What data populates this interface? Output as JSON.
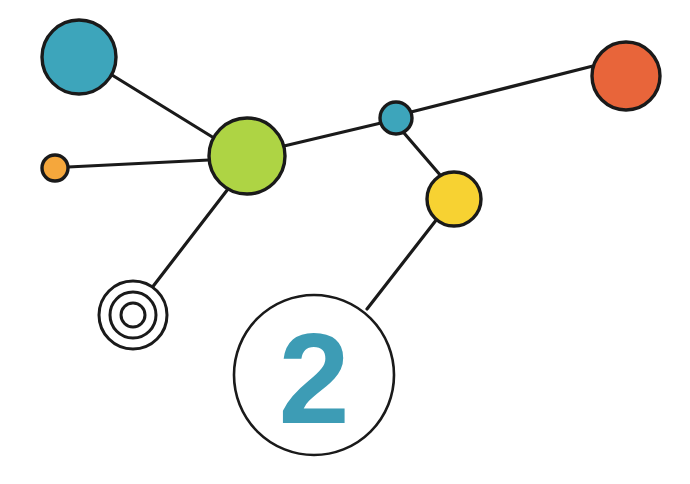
{
  "canvas": {
    "width": 690,
    "height": 484,
    "background": "#ffffff"
  },
  "diagram": {
    "title": "",
    "type": "node-link-network",
    "stroke_color": "#1a1a1a",
    "stroke_width": 3.2
  },
  "palette": {
    "teal": "#3da5bb",
    "green": "#aed444",
    "orange": "#f5a73c",
    "red_orange": "#e8653a",
    "yellow": "#f7d232",
    "outline": "#1a1a1a",
    "white": "#ffffff",
    "badge_text": "#3d9cb5"
  },
  "nodes": [
    {
      "id": "node-teal-large",
      "name": "node-teal-large",
      "shape": "filled-circle",
      "cx": 79,
      "cy": 57,
      "r": 37,
      "fill": "#3da5bb",
      "label": ""
    },
    {
      "id": "node-orange-small",
      "name": "node-orange-small",
      "shape": "filled-circle",
      "cx": 55,
      "cy": 168,
      "r": 13,
      "fill": "#f5a73c",
      "label": ""
    },
    {
      "id": "node-green-large",
      "name": "node-green-large",
      "shape": "filled-circle",
      "cx": 247,
      "cy": 156,
      "r": 38,
      "fill": "#aed444",
      "label": ""
    },
    {
      "id": "node-teal-small",
      "name": "node-teal-small",
      "shape": "filled-circle",
      "cx": 396,
      "cy": 118,
      "r": 16,
      "fill": "#3da5bb",
      "label": ""
    },
    {
      "id": "node-red-orange",
      "name": "node-red-orange",
      "shape": "filled-circle",
      "cx": 626,
      "cy": 76,
      "r": 34,
      "fill": "#e8653a",
      "label": ""
    },
    {
      "id": "node-yellow",
      "name": "node-yellow",
      "shape": "filled-circle",
      "cx": 454,
      "cy": 199,
      "r": 27,
      "fill": "#f7d232",
      "label": ""
    },
    {
      "id": "node-bullseye",
      "name": "node-bullseye-target",
      "shape": "concentric-rings",
      "cx": 133,
      "cy": 315,
      "r": 34,
      "fill": "#ffffff",
      "rings": [
        34,
        23,
        12
      ],
      "label": ""
    },
    {
      "id": "node-badge-two",
      "name": "node-badge-number",
      "shape": "outline-circle",
      "cx": 314,
      "cy": 375,
      "r": 80,
      "fill": "#ffffff",
      "label": "2"
    }
  ],
  "edges": [
    {
      "id": "edge-teal-green",
      "name": "edge-teal-large-to-green",
      "x1": 112,
      "y1": 75,
      "x2": 214,
      "y2": 138
    },
    {
      "id": "edge-orange-green",
      "name": "edge-orange-to-green",
      "x1": 68,
      "y1": 167,
      "x2": 209,
      "y2": 160
    },
    {
      "id": "edge-green-teal2",
      "name": "edge-green-to-teal-small",
      "x1": 284,
      "y1": 146,
      "x2": 381,
      "y2": 123
    },
    {
      "id": "edge-green-bulls",
      "name": "edge-green-to-bullseye",
      "x1": 228,
      "y1": 189,
      "x2": 151,
      "y2": 289
    },
    {
      "id": "edge-teal2-red",
      "name": "edge-teal-small-to-red",
      "x1": 411,
      "y1": 112,
      "x2": 593,
      "y2": 66
    },
    {
      "id": "edge-teal2-yellow",
      "name": "edge-teal-small-to-yellow",
      "x1": 404,
      "y1": 133,
      "x2": 441,
      "y2": 176
    },
    {
      "id": "edge-yellow-badge",
      "name": "edge-yellow-to-badge",
      "x1": 437,
      "y1": 219,
      "x2": 367,
      "y2": 309
    }
  ],
  "badge": {
    "text": "2",
    "color": "#3d9cb5",
    "font_size": 128
  }
}
